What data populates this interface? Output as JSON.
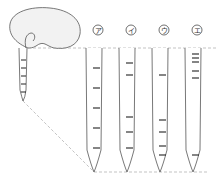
{
  "diagram": {
    "type": "root-growth-marking-illustration",
    "colors": {
      "stroke": "#555555",
      "tick": "#222222",
      "dashed": "#aaaaaa",
      "seed_fill": "#f2f2f2"
    },
    "seedling": {
      "root_ticks_y": [
        60,
        68,
        76,
        84,
        92
      ]
    },
    "options": [
      {
        "label": "ア",
        "x": 94,
        "ticks_y": [
          68,
          88,
          108,
          128,
          148
        ]
      },
      {
        "label": "イ",
        "x": 127,
        "ticks_y": [
          63,
          75,
          117,
          132,
          148
        ]
      },
      {
        "label": "ウ",
        "x": 160,
        "ticks_y": [
          75,
          120,
          132,
          146,
          155
        ]
      },
      {
        "label": "エ",
        "x": 193,
        "ticks_y": [
          54,
          58,
          62,
          71,
          78,
          155
        ]
      }
    ]
  }
}
